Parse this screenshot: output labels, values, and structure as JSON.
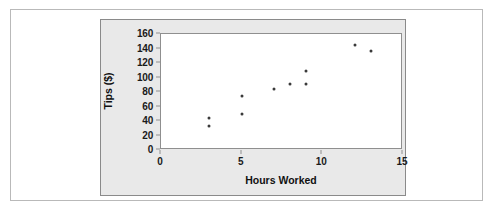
{
  "chart_data": {
    "type": "scatter",
    "title": "",
    "xlabel": "Hours Worked",
    "ylabel": "Tips ($)",
    "xlim": [
      0,
      15
    ],
    "ylim": [
      0,
      160
    ],
    "xticks": [
      0,
      5,
      10,
      15
    ],
    "yticks": [
      0,
      20,
      40,
      60,
      80,
      100,
      120,
      140,
      160
    ],
    "grid": false,
    "legend": null,
    "marker_color": "#3a3a3a",
    "points": [
      {
        "x": 3,
        "y": 44
      },
      {
        "x": 3,
        "y": 33
      },
      {
        "x": 5,
        "y": 75
      },
      {
        "x": 5,
        "y": 50
      },
      {
        "x": 7,
        "y": 84
      },
      {
        "x": 8,
        "y": 91
      },
      {
        "x": 9,
        "y": 109
      },
      {
        "x": 9,
        "y": 91
      },
      {
        "x": 12,
        "y": 145
      },
      {
        "x": 13,
        "y": 136
      }
    ]
  },
  "style": {
    "panel_background": "#e9e9e9",
    "plot_background": "#ffffff",
    "frame_color": "#8f8f8f",
    "card_border": "#b9b9b9"
  }
}
